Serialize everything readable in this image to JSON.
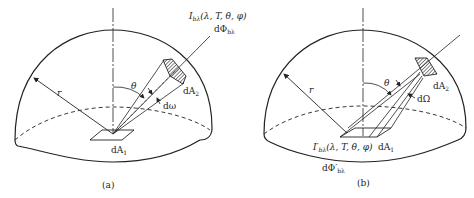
{
  "figure": {
    "panels": [
      {
        "id": "a",
        "caption": "(a)",
        "labels": {
          "radius": "r",
          "angle": "θ",
          "solid_angle": "dω",
          "area_source": "dA",
          "area_source_sub": "1",
          "area_target": "dA",
          "area_target_sub": "2",
          "intensity_main": "I",
          "intensity_sub": "bλ",
          "intensity_args": "(λ, T, θ, φ)",
          "flux_main": "dΦ",
          "flux_sub": "bλ"
        }
      },
      {
        "id": "b",
        "caption": "(b)",
        "labels": {
          "radius": "r",
          "angle": "θ",
          "solid_angle": "dΩ",
          "area_source": "dA",
          "area_source_sub": "1",
          "area_target": "dA",
          "area_target_sub": "2",
          "intensity_main": "I′",
          "intensity_sub": "bλ",
          "intensity_args": "(λ, T, θ, φ)",
          "flux_main": "dΦ′",
          "flux_sub": "bλ"
        }
      }
    ],
    "colors": {
      "line": "#222222",
      "background": "#ffffff",
      "hatch": "#333333"
    }
  }
}
